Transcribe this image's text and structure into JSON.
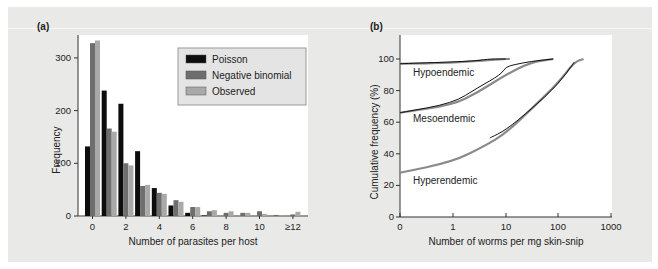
{
  "panel_labels": {
    "a": "(a)",
    "b": "(b)"
  },
  "chart_data": [
    {
      "type": "bar",
      "title": "(a)",
      "xlabel": "Number of parasites per host",
      "ylabel": "Frequency",
      "ylim": [
        0,
        345
      ],
      "yticks": [
        0,
        100,
        200,
        300
      ],
      "categories": [
        "0",
        "1",
        "2",
        "3",
        "4",
        "5",
        "6",
        "7",
        "8",
        "9",
        "10",
        "11",
        "≥12"
      ],
      "xtick_labels": [
        "0",
        "2",
        "4",
        "6",
        "8",
        "10",
        "≥12"
      ],
      "legend": {
        "position": "upper right",
        "entries": [
          "Poisson",
          "Negative binomial",
          "Observed"
        ]
      },
      "colors": {
        "Poisson": "#0d0d0d",
        "Negative binomial": "#6e6e6e",
        "Observed": "#a9a9a9"
      },
      "series": [
        {
          "name": "Poisson",
          "values": [
            132,
            238,
            213,
            123,
            53,
            20,
            6,
            1,
            0,
            0,
            0,
            0,
            0
          ]
        },
        {
          "name": "Negative binomial",
          "values": [
            328,
            166,
            100,
            57,
            44,
            30,
            17,
            9,
            6,
            6,
            9,
            2,
            3
          ]
        },
        {
          "name": "Observed",
          "values": [
            333,
            160,
            96,
            59,
            42,
            27,
            17,
            11,
            9,
            6,
            4,
            1,
            8
          ]
        }
      ],
      "grid": false
    },
    {
      "type": "line",
      "title": "(b)",
      "xlabel": "Number of worms per mg skin-snip",
      "ylabel": "Cumulative frequency (%)",
      "xscale": "log(x+1)",
      "xtick_labels": [
        "0",
        "1",
        "10",
        "100",
        "1000"
      ],
      "yticks": [
        0,
        20,
        40,
        60,
        80,
        100
      ],
      "ylim": [
        0,
        110
      ],
      "annotations": [
        "Hypoendemic",
        "Mesoendemic",
        "Hyperendemic"
      ],
      "series": [
        {
          "name": "Hypoendemic (fitted)",
          "x": [
            0,
            1,
            3,
            10
          ],
          "y": [
            97,
            97.5,
            99,
            100
          ]
        },
        {
          "name": "Hypoendemic (observed)",
          "x": [
            0,
            2,
            4,
            5,
            12
          ],
          "y": [
            97,
            98.5,
            99.5,
            100,
            100
          ]
        },
        {
          "name": "Mesoendemic (fitted)",
          "x": [
            0,
            1,
            3,
            10,
            30,
            80
          ],
          "y": [
            66,
            71,
            79,
            90,
            98,
            100
          ]
        },
        {
          "name": "Mesoendemic (observed)",
          "x": [
            0,
            1,
            3,
            8,
            10,
            15,
            30,
            80
          ],
          "y": [
            66,
            72,
            82,
            90,
            95,
            96.5,
            98.5,
            100
          ]
        },
        {
          "name": "Hyperendemic (fitted)",
          "x": [
            0,
            1,
            4,
            10,
            30,
            100,
            200,
            300
          ],
          "y": [
            28,
            35,
            45,
            53,
            68,
            85,
            98,
            100
          ]
        },
        {
          "name": "Hyperendemic (observed)",
          "x": [
            5,
            10,
            30,
            100,
            200
          ],
          "y": [
            50,
            55,
            68,
            84,
            98
          ]
        }
      ],
      "colors": {
        "fitted": "#8a8a8a",
        "observed": "#111111"
      },
      "grid": false
    }
  ]
}
